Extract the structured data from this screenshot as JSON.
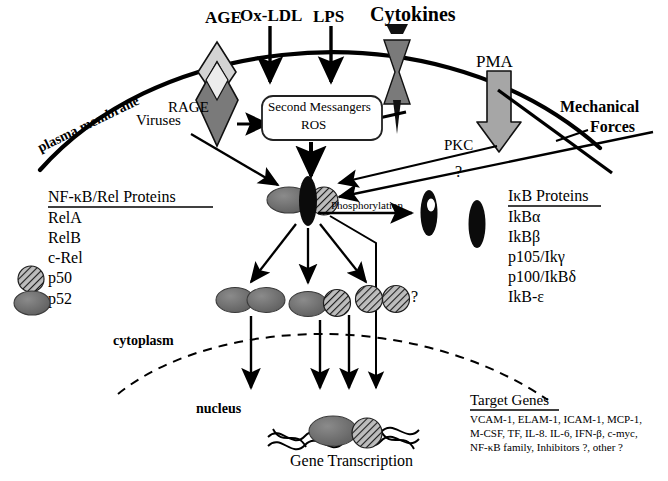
{
  "figure": {
    "domain": "biology-signaling-pathway",
    "background_color": "#ffffff",
    "ink_color": "#000000",
    "gray_fill": "#6e6e6e",
    "light_gray_fill": "#c9c9c9",
    "hatch_fill": "#8a8a8a"
  },
  "stimuli": {
    "age": "AGE",
    "ox_ldl": "Ox-LDL",
    "lps": "LPS",
    "cytokines": "Cytokines",
    "pma": "PMA",
    "mechanical_forces_line1": "Mechanical",
    "mechanical_forces_line2": "Forces",
    "viruses": "Viruses"
  },
  "membrane": {
    "label": "plasma membrane",
    "receptor_rage": "RAGE",
    "kinase_pkc": "PKC"
  },
  "second_messengers": {
    "line1": "Second Messangers",
    "line2": "ROS"
  },
  "complex": {
    "phosphorylation_label": "Phosphorylation",
    "question_mark_pkc": "?",
    "question_mark_dimers": "?"
  },
  "compartments": {
    "cytoplasm": "cytoplasm",
    "nucleus": "nucleus"
  },
  "transcription": {
    "label": "Gene Transcription"
  },
  "nfkb_panel": {
    "title": "NF-κB/Rel Proteins",
    "items": [
      {
        "label": "RelA",
        "icon": "none"
      },
      {
        "label": "RelB",
        "icon": "none"
      },
      {
        "label": "c-Rel",
        "icon": "none"
      },
      {
        "label": "p50",
        "icon": "hatched-circle"
      },
      {
        "label": "p52",
        "icon": "gray-ellipse"
      }
    ]
  },
  "ikb_panel": {
    "title": "IκB Proteins",
    "items": [
      "IkBα",
      "IkBβ",
      "p105/Ikγ",
      "p100/IkBδ",
      "IkB-ε"
    ]
  },
  "target_genes_panel": {
    "title": "Target Genes",
    "lines": [
      "VCAM-1, ELAM-1, ICAM-1, MCP-1,",
      "M-CSF, TF, IL-8. IL-6, IFN-β, c-myc,",
      "NF-κB family, Inhibitors ?,  other ?"
    ]
  }
}
